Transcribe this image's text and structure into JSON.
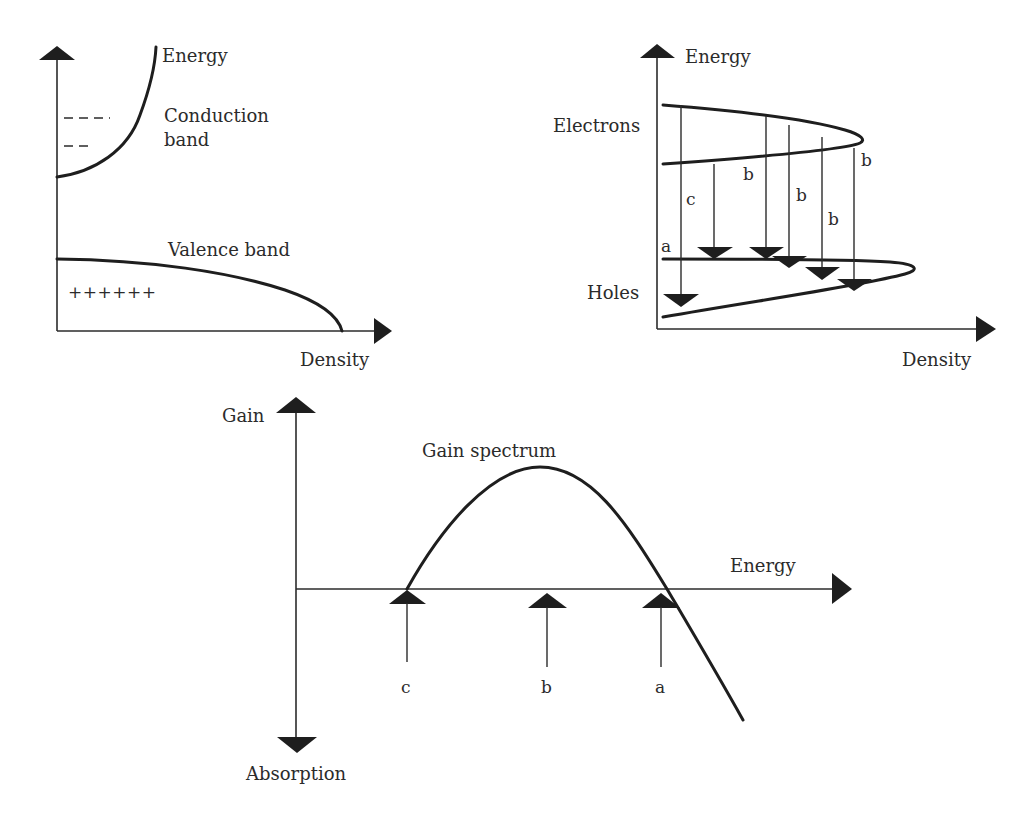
{
  "panel_band_structure": {
    "y_axis_label": "Energy",
    "x_axis_label": "Density",
    "conduction_label_line1": "Conduction",
    "conduction_label_line2": "band",
    "valence_label": "Valence band",
    "holes_symbols": "++++++"
  },
  "panel_transitions": {
    "y_axis_label": "Energy",
    "x_axis_label": "Density",
    "electrons_label": "Electrons",
    "holes_label": "Holes",
    "transition_labels": {
      "a": "a",
      "c": "c",
      "b1": "b",
      "b2": "b",
      "b3": "b",
      "b4": "b"
    }
  },
  "panel_gain": {
    "y_axis_top_label": "Gain",
    "y_axis_bottom_label": "Absorption",
    "x_axis_label": "Energy",
    "curve_label": "Gain spectrum",
    "markers": [
      {
        "label": "c"
      },
      {
        "label": "b"
      },
      {
        "label": "a"
      }
    ]
  },
  "colors": {
    "ink": "#1e1e1e",
    "background": "#ffffff"
  }
}
